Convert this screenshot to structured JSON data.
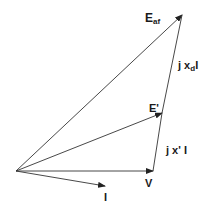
{
  "diagram": {
    "type": "phasor-diagram",
    "title": "",
    "origin": [
      16,
      171
    ],
    "vectors": [
      {
        "id": "V",
        "label": "V",
        "from": [
          16,
          171
        ],
        "to": [
          153,
          171
        ],
        "arrow": true
      },
      {
        "id": "I",
        "label": "I",
        "from": [
          16,
          171
        ],
        "to": [
          105,
          186
        ],
        "arrow": true
      },
      {
        "id": "E_prime",
        "label": "E'",
        "from": [
          16,
          171
        ],
        "to": [
          162,
          113
        ],
        "arrow": true
      },
      {
        "id": "E_af",
        "label": "Eaf",
        "from": [
          16,
          171
        ],
        "to": [
          182,
          15
        ],
        "arrow": true
      },
      {
        "id": "jx_prime_I",
        "label": "j x' I",
        "from": [
          153,
          171
        ],
        "to": [
          162,
          113
        ],
        "arrow": false
      },
      {
        "id": "jx_d_I",
        "label": "j xd I",
        "from": [
          162,
          113
        ],
        "to": [
          182,
          15
        ],
        "arrow": false
      }
    ],
    "labels": {
      "e_af_main": "E",
      "e_af_sub": "af",
      "jxd_prefix": "j x",
      "jxd_sub": "d",
      "jxd_suffix": "I",
      "e_prime": "E'",
      "jx_prime_i": "j x' I",
      "v": "V",
      "i": "I"
    },
    "colors": {
      "line": "#333333",
      "text": "#1a1a1a",
      "background": "#ffffff"
    }
  }
}
